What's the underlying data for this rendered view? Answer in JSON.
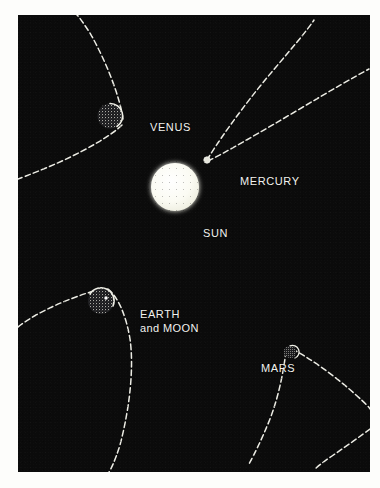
{
  "figure": {
    "background_color": "#0b0b0b",
    "ink_color": "#f2f2ee",
    "border_color": "#fdfdfb"
  },
  "bodies": [
    {
      "id": "sun",
      "label": "SUN",
      "kind": "star",
      "cx": 175,
      "cy": 187,
      "r": 24,
      "fill": "#fbfbf2",
      "texture": "solid"
    },
    {
      "id": "mercury",
      "label": "MERCURY",
      "kind": "planet",
      "cx": 207,
      "cy": 160,
      "r": 3,
      "fill": "#cfcfc6",
      "texture": "speckled"
    },
    {
      "id": "venus",
      "label": "VENUS",
      "kind": "planet",
      "cx": 110,
      "cy": 116,
      "r": 13,
      "fill": "#4a4a44",
      "texture": "speckled"
    },
    {
      "id": "earth",
      "label": "EARTH",
      "sublabel": "and MOON",
      "kind": "planet",
      "cx": 101,
      "cy": 301,
      "r": 13,
      "fill": "#4a4a44",
      "texture": "speckled"
    },
    {
      "id": "moon",
      "label": "MOON",
      "kind": "moon",
      "cx": 105,
      "cy": 298,
      "r": 1.6,
      "fill": "#ffffff",
      "texture": "solid"
    },
    {
      "id": "mars",
      "label": "MARS",
      "kind": "planet",
      "cx": 290,
      "cy": 352,
      "r": 6,
      "fill": "#4a4a44",
      "texture": "speckled"
    }
  ],
  "orbits": [
    {
      "id": "mercury-orbit",
      "body": "mercury",
      "style": "dashed",
      "apex": [
        207,
        160
      ],
      "description": "narrow parabolic arc opening toward upper right"
    },
    {
      "id": "venus-orbit",
      "body": "venus",
      "style": "dashed",
      "apex": [
        123,
        121
      ],
      "description": "parabolic arc opening toward upper left"
    },
    {
      "id": "earth-orbit",
      "body": "earth",
      "style": "dashed",
      "apex": [
        104,
        289
      ],
      "description": "parabolic arc opening toward lower left and lower center"
    },
    {
      "id": "mars-orbit",
      "body": "mars",
      "style": "dashed",
      "apex": [
        288,
        349
      ],
      "description": "parabolic arc opening toward lower right"
    }
  ],
  "labels": {
    "venus": "VENUS",
    "mercury": "MERCURY",
    "sun": "SUN",
    "earth_line1": "EARTH",
    "earth_line2": "and MOON",
    "mars": "MARS"
  }
}
